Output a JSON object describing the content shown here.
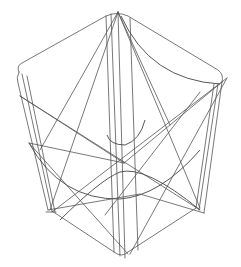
{
  "figure": {
    "type": "wireframe-3d-shape",
    "background_color": "#ffffff",
    "stroke_color": "#555555"
  }
}
